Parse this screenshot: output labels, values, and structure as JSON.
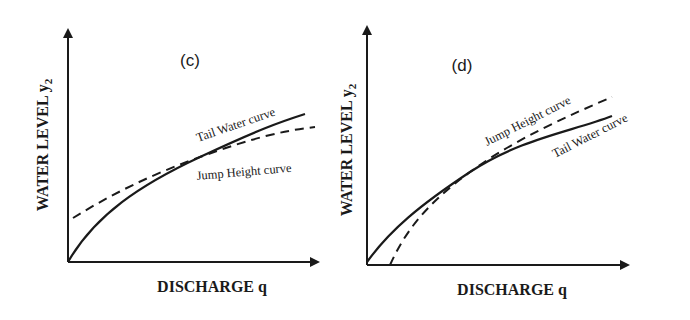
{
  "panels": [
    {
      "id": "c",
      "label": "(c)",
      "y_axis_label": "WATER LEVEL y",
      "y_axis_subscript": "2",
      "x_axis_label": "DISCHARGE q",
      "curves": [
        {
          "name": "Tail Water curve",
          "style": "solid",
          "label": "Tail Water curve"
        },
        {
          "name": "Jump Height curve",
          "style": "dashed",
          "label": "Jump Height curve"
        }
      ],
      "description": "Jump height curve above tail water curve at low discharge, below it at high discharge; curves intersect"
    },
    {
      "id": "d",
      "label": "(d)",
      "y_axis_label": "WATER LEVEL y",
      "y_axis_subscript": "2",
      "x_axis_label": "DISCHARGE q",
      "curves": [
        {
          "name": "Jump Height curve",
          "style": "dashed",
          "label": "Jump Height curve"
        },
        {
          "name": "Tail Water curve",
          "style": "solid",
          "label": "Tail Water curve"
        }
      ],
      "description": "Tail water curve above jump height curve at low discharge, below it at high discharge; curves intersect"
    }
  ],
  "colors": {
    "ink": "#1a1a1a",
    "background": "#ffffff"
  }
}
